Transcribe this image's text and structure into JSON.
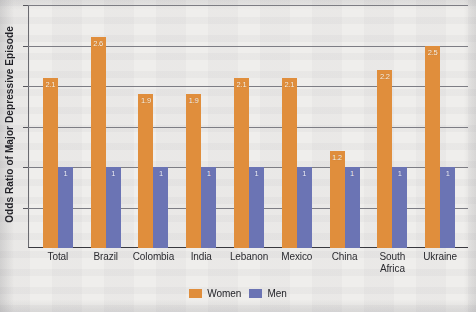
{
  "chart_data": {
    "type": "bar",
    "title": "",
    "subtitle": "",
    "xlabel": "",
    "ylabel": "Odds Ratio of Major Depressive Episode",
    "categories": [
      "Total",
      "Brazil",
      "Colombia",
      "India",
      "Lebanon",
      "Mexico",
      "China",
      "South Africa",
      "Ukraine"
    ],
    "series": [
      {
        "name": "Women",
        "color": "#e08e3c",
        "values": [
          2.1,
          2.6,
          1.9,
          1.9,
          2.1,
          2.1,
          1.2,
          2.2,
          2.5
        ],
        "data_labels": [
          "2.1",
          "2.6",
          "1.9",
          "1.9",
          "2.1",
          "2.1",
          "1.2",
          "2.2",
          "2.5"
        ]
      },
      {
        "name": "Men",
        "color": "#6b74b4",
        "values": [
          1,
          1,
          1,
          1,
          1,
          1,
          1,
          1,
          1
        ],
        "data_labels": [
          "1",
          "1",
          "1",
          "1",
          "1",
          "1",
          "1",
          "1",
          "1"
        ]
      }
    ],
    "ylim": [
      0,
      3.0
    ],
    "grid": true,
    "gridline_values": [
      3.0,
      2.5,
      2.0,
      1.5,
      1.0,
      0.5
    ],
    "y_tick_labels": [],
    "legend_position": "bottom-center",
    "legend": [
      "Women",
      "Men"
    ]
  },
  "axis": {
    "y_title": "Odds Ratio of Major Depressive Episode"
  },
  "legend": {
    "items": [
      {
        "label": "Women",
        "color": "#e08e3c",
        "swatch": "women-swatch"
      },
      {
        "label": "Men",
        "color": "#6b74b4",
        "swatch": "men-swatch"
      }
    ]
  }
}
